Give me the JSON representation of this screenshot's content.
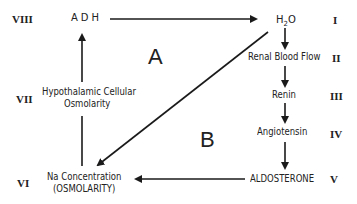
{
  "diagram": {
    "regions": {
      "a": "A",
      "b": "B"
    },
    "nodes": {
      "adh": {
        "label": "ADH",
        "roman": "VIII"
      },
      "h2o": {
        "label_main": "H",
        "label_sub": "2",
        "label_tail": "O",
        "roman": "I"
      },
      "renal": {
        "label": "Renal Blood Flow",
        "roman": "II"
      },
      "renin": {
        "label": "Renin",
        "roman": "III"
      },
      "angiotensin": {
        "label": "Angiotensin",
        "roman": "IV"
      },
      "aldosterone": {
        "label": "ALDOSTERONE",
        "roman": "V"
      },
      "na": {
        "label_line1": "Na Concentration",
        "label_line2": "(OSMOLARITY)",
        "roman": "VI"
      },
      "hypothalamic": {
        "label_line1": "Hypothalamic Cellular",
        "label_line2": "Osmolarity",
        "roman": "VII"
      }
    },
    "edges": [
      {
        "from": "ADH",
        "to": "H2O"
      },
      {
        "from": "H2O",
        "to": "Renal Blood Flow"
      },
      {
        "from": "Renal Blood Flow",
        "to": "Renin"
      },
      {
        "from": "Renin",
        "to": "Angiotensin"
      },
      {
        "from": "Angiotensin",
        "to": "ALDOSTERONE"
      },
      {
        "from": "ALDOSTERONE",
        "to": "Na Concentration"
      },
      {
        "from": "H2O",
        "to": "Na Concentration"
      },
      {
        "from": "Na Concentration",
        "to": "Hypothalamic Cellular Osmolarity"
      },
      {
        "from": "Hypothalamic Cellular Osmolarity",
        "to": "ADH"
      }
    ]
  }
}
